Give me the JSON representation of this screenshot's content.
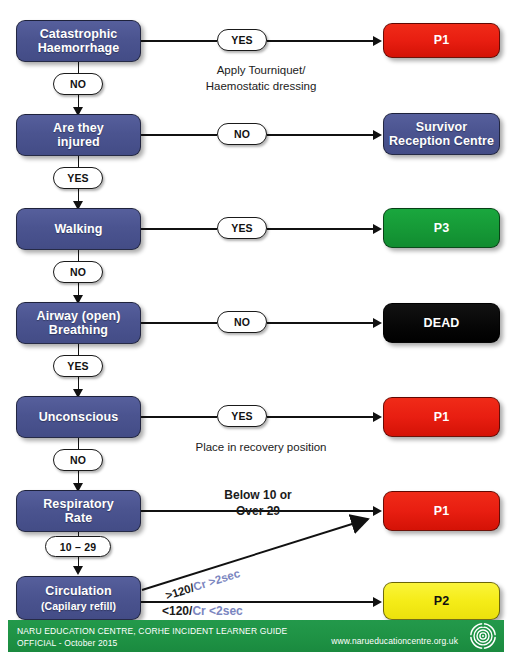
{
  "nodes": {
    "catastrophic_haemorrhage": "Catastrophic\nHaemorrhage",
    "catastrophic_haemorrhage_l1": "Catastrophic",
    "catastrophic_haemorrhage_l2": "Haemorrhage",
    "are_they_injured_l1": "Are they",
    "are_they_injured_l2": "injured",
    "walking": "Walking",
    "airway_l1": "Airway (open)",
    "airway_l2": "Breathing",
    "unconscious": "Unconscious",
    "respiratory_l1": "Respiratory",
    "respiratory_l2": "Rate",
    "circulation_l1": "Circulation",
    "circulation_l2": "(Capilary refill)"
  },
  "outcomes": {
    "p1_haemorrhage": "P1",
    "survivor_reception_l1": "Survivor",
    "survivor_reception_l2": "Reception Centre",
    "p3_walking": "P3",
    "dead": "DEAD",
    "p1_unconscious": "P1",
    "p1_respiratory": "P1",
    "p2_circulation": "P2"
  },
  "decisions": {
    "haemorrhage_yes": "YES",
    "haemorrhage_no": "NO",
    "injured_no": "NO",
    "injured_yes": "YES",
    "walking_yes": "YES",
    "walking_no": "NO",
    "airway_no": "NO",
    "airway_yes": "YES",
    "unconscious_yes": "YES",
    "unconscious_no": "NO",
    "respiratory_range": "10 – 29"
  },
  "annotations": {
    "tourniquet_l1": "Apply Tourniquet/",
    "tourniquet_l2": "Haemostatic dressing",
    "recovery_position": "Place in recovery position",
    "respiratory_l1": "Below 10 or",
    "respiratory_l2": "Over 29",
    "circulation_high_a": ">120/",
    "circulation_high_b": "Cr >2sec",
    "circulation_low_a": "<120/",
    "circulation_low_b": "Cr <2sec"
  },
  "footer": {
    "line1": "NARU EDUCATION CENTRE, CORHE INCIDENT LEARNER GUIDE",
    "line2": "OFFICIAL - October 2015",
    "url": "www.narueducationcentre.org.uk",
    "logo": "concentric-target-logo"
  },
  "colors": {
    "node_blue": "#4b5490",
    "priority_red": "#e81e11",
    "priority_green": "#169a37",
    "priority_yellow": "#f5ec18",
    "dead_black": "#060606",
    "footer_green": "#1f9345",
    "cr_accent": "#7b86c0"
  }
}
